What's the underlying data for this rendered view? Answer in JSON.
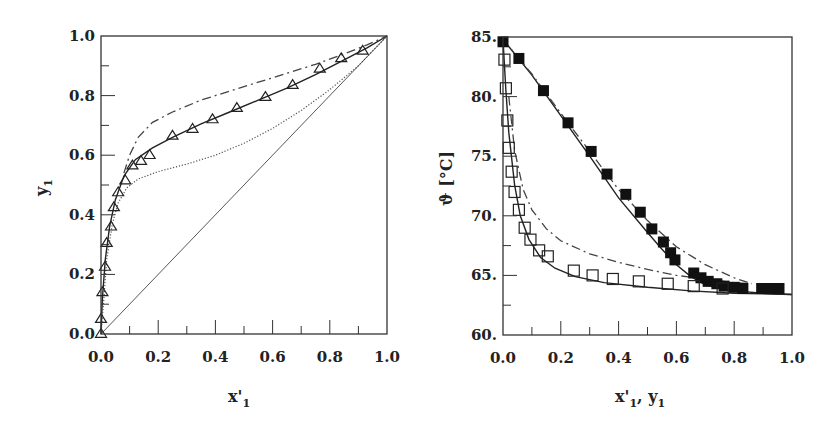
{
  "chart_data": [
    {
      "type": "scatter",
      "title": "",
      "xlabel": "x'1",
      "ylabel": "y1",
      "xlim": [
        0.0,
        1.0
      ],
      "ylim": [
        0.0,
        1.0
      ],
      "grid": false,
      "legend": null,
      "x_ticks": [
        "0.0",
        "0.2",
        "0.4",
        "0.6",
        "0.8",
        "1.0"
      ],
      "y_ticks": [
        "0.0",
        "0.2",
        "0.4",
        "0.6",
        "0.8",
        "1.0"
      ],
      "series": [
        {
          "name": "experimental (triangles)",
          "marker": "open-triangle",
          "x": [
            0.0,
            0.0,
            0.005,
            0.014,
            0.02,
            0.035,
            0.045,
            0.06,
            0.085,
            0.11,
            0.14,
            0.17,
            0.25,
            0.32,
            0.39,
            0.475,
            0.575,
            0.67,
            0.765,
            0.84,
            0.915
          ],
          "y": [
            0.0,
            0.05,
            0.14,
            0.225,
            0.305,
            0.36,
            0.425,
            0.475,
            0.515,
            0.565,
            0.58,
            0.6,
            0.665,
            0.688,
            0.72,
            0.758,
            0.795,
            0.835,
            0.89,
            0.925,
            0.95
          ]
        },
        {
          "name": "model (solid)",
          "line": "solid",
          "x": [
            0.0,
            0.005,
            0.015,
            0.03,
            0.05,
            0.08,
            0.12,
            0.18,
            0.25,
            0.35,
            0.45,
            0.55,
            0.65,
            0.75,
            0.85,
            0.93,
            1.0
          ],
          "y": [
            0.0,
            0.12,
            0.25,
            0.36,
            0.45,
            0.53,
            0.585,
            0.625,
            0.66,
            0.705,
            0.745,
            0.785,
            0.825,
            0.87,
            0.92,
            0.96,
            1.0
          ]
        },
        {
          "name": "model (dash-dot)",
          "line": "dash-dot",
          "x": [
            0.08,
            0.1,
            0.13,
            0.18,
            0.25,
            0.35,
            0.45,
            0.55,
            0.65,
            0.75,
            0.85,
            0.93,
            1.0
          ],
          "y": [
            0.54,
            0.6,
            0.66,
            0.71,
            0.745,
            0.785,
            0.815,
            0.845,
            0.875,
            0.905,
            0.94,
            0.97,
            1.0
          ]
        },
        {
          "name": "model (dotted)",
          "line": "dotted",
          "x": [
            0.0,
            0.01,
            0.02,
            0.04,
            0.06,
            0.09,
            0.13,
            0.2,
            0.3,
            0.4,
            0.5,
            0.6,
            0.7,
            0.8,
            0.9,
            1.0
          ],
          "y": [
            0.0,
            0.12,
            0.25,
            0.37,
            0.44,
            0.49,
            0.52,
            0.545,
            0.57,
            0.6,
            0.64,
            0.69,
            0.75,
            0.82,
            0.9,
            1.0
          ]
        },
        {
          "name": "diagonal",
          "line": "solid-thin",
          "x": [
            0.0,
            1.0
          ],
          "y": [
            0.0,
            1.0
          ]
        }
      ]
    },
    {
      "type": "scatter",
      "title": "",
      "xlabel": "x'1, y1",
      "ylabel": "ϑ [°C]",
      "xlim": [
        0.0,
        1.0
      ],
      "ylim": [
        60,
        85
      ],
      "grid": false,
      "legend": null,
      "x_ticks": [
        "0.0",
        "0.2",
        "0.4",
        "0.6",
        "0.8",
        "1.0"
      ],
      "y_ticks": [
        "60.",
        "65.",
        "70.",
        "75.",
        "80.",
        "85."
      ],
      "series": [
        {
          "name": "liquid experimental (filled squares)",
          "marker": "filled-square",
          "x": [
            0.0,
            0.055,
            0.14,
            0.225,
            0.305,
            0.36,
            0.425,
            0.475,
            0.515,
            0.555,
            0.58,
            0.595,
            0.66,
            0.685,
            0.71,
            0.74,
            0.765,
            0.8,
            0.83,
            0.895,
            0.925,
            0.955
          ],
          "y": [
            84.6,
            83.2,
            80.5,
            77.8,
            75.4,
            73.5,
            71.8,
            70.3,
            68.9,
            67.8,
            66.9,
            66.3,
            65.2,
            64.8,
            64.5,
            64.3,
            64.1,
            64.0,
            63.9,
            63.9,
            63.9,
            63.9
          ]
        },
        {
          "name": "vapor experimental (open squares)",
          "marker": "open-square",
          "x": [
            0.005,
            0.01,
            0.015,
            0.02,
            0.03,
            0.04,
            0.055,
            0.075,
            0.095,
            0.125,
            0.155,
            0.245,
            0.31,
            0.38,
            0.47,
            0.57,
            0.66,
            0.76
          ],
          "y": [
            83.1,
            80.7,
            78.0,
            75.7,
            73.7,
            72.0,
            70.5,
            69.0,
            68.0,
            67.1,
            66.6,
            65.4,
            65.0,
            64.7,
            64.5,
            64.3,
            64.1,
            63.9
          ]
        },
        {
          "name": "bubble curve (solid)",
          "line": "solid",
          "x": [
            0.0,
            0.05,
            0.1,
            0.2,
            0.3,
            0.4,
            0.5,
            0.55,
            0.6,
            0.65,
            0.7,
            0.8,
            0.9,
            1.0
          ],
          "y": [
            84.8,
            83.3,
            81.8,
            78.4,
            75.0,
            71.5,
            68.6,
            67.2,
            65.9,
            64.9,
            64.2,
            63.7,
            63.5,
            63.4
          ]
        },
        {
          "name": "dew curve (solid)",
          "line": "solid",
          "x": [
            0.0,
            0.01,
            0.02,
            0.04,
            0.06,
            0.09,
            0.13,
            0.18,
            0.25,
            0.35,
            0.5,
            0.65,
            0.8,
            1.0
          ],
          "y": [
            84.8,
            80.5,
            77.0,
            72.6,
            70.0,
            68.0,
            66.5,
            65.6,
            64.9,
            64.4,
            64.0,
            63.7,
            63.5,
            63.4
          ]
        },
        {
          "name": "bubble curve (dash-dot)",
          "line": "dash-dot",
          "x": [
            0.0,
            0.1,
            0.2,
            0.3,
            0.4,
            0.5,
            0.6,
            0.7,
            0.8,
            0.86
          ],
          "y": [
            84.8,
            81.9,
            78.6,
            75.4,
            72.2,
            69.6,
            67.4,
            65.9,
            64.8,
            64.3
          ]
        },
        {
          "name": "dew curve (dash-dot)",
          "line": "dash-dot",
          "x": [
            0.02,
            0.04,
            0.07,
            0.1,
            0.15,
            0.2,
            0.3,
            0.4,
            0.5,
            0.6,
            0.7,
            0.8,
            0.86
          ],
          "y": [
            80.0,
            75.5,
            72.2,
            70.5,
            68.9,
            67.9,
            66.8,
            66.1,
            65.5,
            65.0,
            64.7,
            64.4,
            64.3
          ]
        }
      ]
    }
  ],
  "charts": {
    "left": {
      "ylabel_main": "y",
      "ylabel_sub": "1",
      "xlabel_main": "x'",
      "xlabel_sub": "1",
      "x_ticks": [
        "0.0",
        "0.2",
        "0.4",
        "0.6",
        "0.8",
        "1.0"
      ],
      "y_ticks": [
        "0.0",
        "0.2",
        "0.4",
        "0.6",
        "0.8",
        "1.0"
      ]
    },
    "right": {
      "ylabel": "ϑ [°C]",
      "xlabel_a": "x'",
      "xlabel_a_sub": "1",
      "xlabel_sep": ", y",
      "xlabel_b_sub": "1",
      "x_ticks": [
        "0.0",
        "0.2",
        "0.4",
        "0.6",
        "0.8",
        "1.0"
      ],
      "y_ticks": [
        "60.",
        "65.",
        "70.",
        "75.",
        "80.",
        "85."
      ]
    }
  }
}
